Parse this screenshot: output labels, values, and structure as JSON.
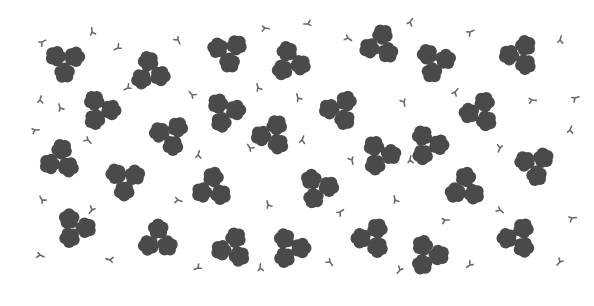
{
  "pattern": {
    "description": "Clover-like flower clusters and small sprigs on white background",
    "background": "#ffffff",
    "flower_color": "#4a4a4a",
    "sprig_color": "#6a6a6a",
    "clusters": [
      [
        65,
        62
      ],
      [
        150,
        72
      ],
      [
        228,
        52
      ],
      [
        290,
        62
      ],
      [
        380,
        45
      ],
      [
        435,
        62
      ],
      [
        520,
        55
      ],
      [
        100,
        110
      ],
      [
        170,
        135
      ],
      [
        225,
        112
      ],
      [
        272,
        135
      ],
      [
        340,
        110
      ],
      [
        428,
        145
      ],
      [
        480,
        112
      ],
      [
        60,
        160
      ],
      [
        125,
        180
      ],
      [
        212,
        188
      ],
      [
        318,
        188
      ],
      [
        380,
        155
      ],
      [
        465,
        188
      ],
      [
        535,
        165
      ],
      [
        75,
        228
      ],
      [
        158,
        240
      ],
      [
        232,
        248
      ],
      [
        290,
        248
      ],
      [
        372,
        238
      ],
      [
        428,
        255
      ],
      [
        518,
        238
      ]
    ],
    "sprigs": [
      [
        42,
        42
      ],
      [
        92,
        32
      ],
      [
        118,
        48
      ],
      [
        178,
        40
      ],
      [
        265,
        28
      ],
      [
        308,
        24
      ],
      [
        348,
        38
      ],
      [
        410,
        22
      ],
      [
        470,
        32
      ],
      [
        560,
        40
      ],
      [
        40,
        100
      ],
      [
        60,
        108
      ],
      [
        128,
        88
      ],
      [
        192,
        95
      ],
      [
        258,
        88
      ],
      [
        298,
        98
      ],
      [
        404,
        102
      ],
      [
        455,
        92
      ],
      [
        532,
        100
      ],
      [
        575,
        98
      ],
      [
        35,
        130
      ],
      [
        88,
        140
      ],
      [
        198,
        155
      ],
      [
        250,
        148
      ],
      [
        302,
        140
      ],
      [
        352,
        160
      ],
      [
        410,
        160
      ],
      [
        500,
        148
      ],
      [
        570,
        130
      ],
      [
        42,
        200
      ],
      [
        92,
        210
      ],
      [
        178,
        200
      ],
      [
        268,
        205
      ],
      [
        340,
        212
      ],
      [
        395,
        200
      ],
      [
        445,
        220
      ],
      [
        500,
        210
      ],
      [
        572,
        218
      ],
      [
        40,
        255
      ],
      [
        110,
        260
      ],
      [
        198,
        268
      ],
      [
        260,
        268
      ],
      [
        330,
        262
      ],
      [
        400,
        270
      ],
      [
        470,
        265
      ],
      [
        560,
        262
      ]
    ]
  }
}
